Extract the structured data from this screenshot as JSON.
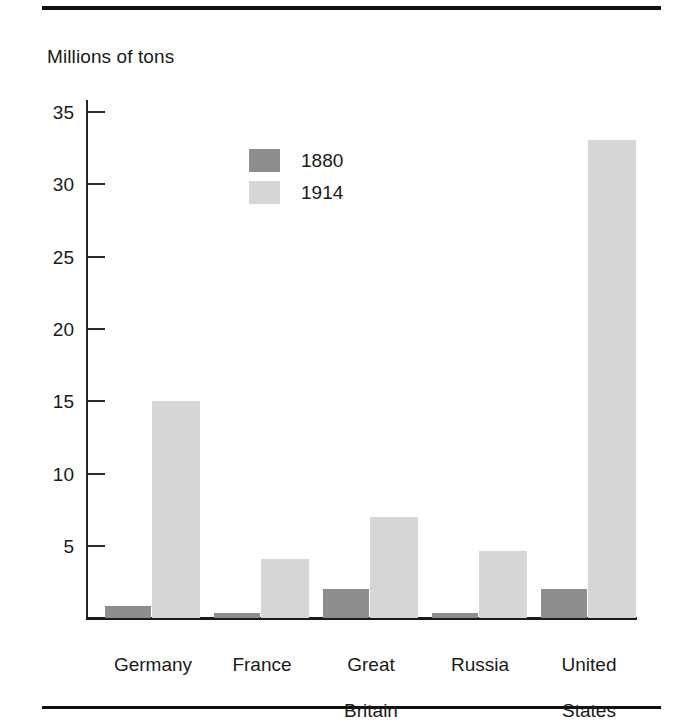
{
  "chart_data": {
    "type": "bar",
    "title": "",
    "subtitle": "",
    "ylabel": "Millions of tons",
    "xlabel": "",
    "ylim": [
      0,
      36
    ],
    "yticks": [
      5,
      10,
      15,
      20,
      25,
      30,
      35
    ],
    "grid": false,
    "legend_position": "inside-upper-left",
    "categories": [
      "Germany",
      "France",
      "Great\nBritain",
      "Russia",
      "United\nStates"
    ],
    "series": [
      {
        "name": "1880",
        "color": "#8d8d8d",
        "values": [
          0.8,
          0.35,
          2.0,
          0.35,
          2.0
        ]
      },
      {
        "name": "1914",
        "color": "#d6d6d6",
        "values": [
          15.0,
          4.1,
          7.0,
          4.6,
          33.0
        ]
      }
    ]
  },
  "axis": {
    "y_title": "Millions of tons",
    "tick_labels": [
      "35",
      "30",
      "25",
      "20",
      "15",
      "10",
      "5"
    ]
  },
  "legend": {
    "entries": [
      {
        "label": "1880",
        "color": "#8d8d8d"
      },
      {
        "label": "1914",
        "color": "#d6d6d6"
      }
    ]
  },
  "categories": [
    {
      "line1": "Germany",
      "line2": ""
    },
    {
      "line1": "France",
      "line2": ""
    },
    {
      "line1": "Great",
      "line2": "Britain"
    },
    {
      "line1": "Russia",
      "line2": ""
    },
    {
      "line1": "United",
      "line2": "States"
    }
  ]
}
